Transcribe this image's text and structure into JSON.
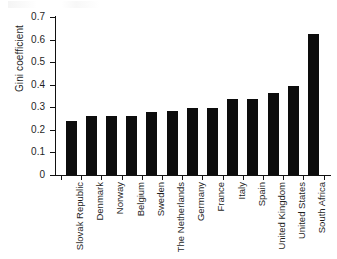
{
  "chart_data": {
    "type": "bar",
    "title": "",
    "xlabel": "",
    "ylabel": "Gini coefficient",
    "ylim": [
      0,
      0.7
    ],
    "grid": false,
    "legend": false,
    "orientation": "vertical",
    "bar_color": "#0c0c0c",
    "categories": [
      "Slovak Republic",
      "Denmark",
      "Norway",
      "Belgium",
      "Sweden",
      "The Netherlands",
      "Germany",
      "France",
      "Italy",
      "Spain",
      "United Kingdom",
      "United States",
      "South Africa"
    ],
    "values": [
      0.24,
      0.26,
      0.26,
      0.26,
      0.28,
      0.285,
      0.295,
      0.295,
      0.335,
      0.335,
      0.365,
      0.395,
      0.625
    ],
    "ytick_labels": [
      "0",
      "0.1",
      "0.2",
      "0.3",
      "0.4",
      "0.5",
      "0.6",
      "0.7"
    ],
    "ytick_values": [
      0,
      0.1,
      0.2,
      0.3,
      0.4,
      0.5,
      0.6,
      0.7
    ]
  }
}
